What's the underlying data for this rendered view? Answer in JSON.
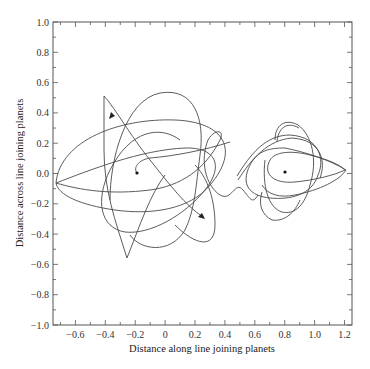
{
  "chart_data": {
    "type": "line",
    "title": "",
    "xlabel": "Distance along line joining planets",
    "ylabel": "Distance across line joining planets",
    "xlim": [
      -0.75,
      1.25
    ],
    "ylim": [
      -1.0,
      1.0
    ],
    "xticks": [
      -0.6,
      -0.4,
      -0.2,
      0,
      0.2,
      0.4,
      0.6,
      0.8,
      1.0,
      1.2
    ],
    "xtick_labels": [
      "−0.6",
      "−0.4",
      "−0.2",
      "0",
      "0.2",
      "0.4",
      "0.6",
      "0.8",
      "1.0",
      "1.2"
    ],
    "yticks": [
      -1.0,
      -0.8,
      -0.6,
      -0.4,
      -0.2,
      0.0,
      0.2,
      0.4,
      0.6,
      0.8,
      1.0
    ],
    "ytick_labels": [
      "−1.0",
      "−0.8",
      "−0.6",
      "−0.4",
      "−0.2",
      "0.0",
      "0.2",
      "0.4",
      "0.6",
      "0.8",
      "1.0"
    ],
    "grid": false,
    "legend": null,
    "points": [
      {
        "name": "planet-1",
        "x": -0.19,
        "y": 0.0
      },
      {
        "name": "planet-2",
        "x": 0.81,
        "y": 0.01
      }
    ],
    "annotations": [
      {
        "type": "arrow",
        "x": -0.38,
        "y": 0.38,
        "direction": "down-left"
      },
      {
        "type": "arrow",
        "x": 0.25,
        "y": -0.29,
        "direction": "down-right"
      }
    ],
    "series": [
      {
        "name": "trajectory",
        "description": "Chaotic trajectory of a test body looping around planet 1 (near x=-0.19) and planet 2 (near x=0.81); starts near planet 2 and ends with arrows near planet 1.",
        "color": "#444444"
      }
    ]
  }
}
